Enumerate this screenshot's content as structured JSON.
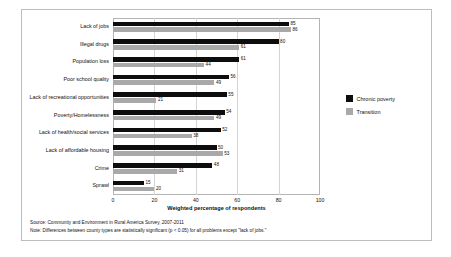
{
  "chart_data": {
    "type": "bar",
    "orientation": "horizontal",
    "title": "",
    "xlabel": "Weighted percentage of respondents",
    "ylabel": "",
    "xlim": [
      0,
      100
    ],
    "xticks": [
      0,
      20,
      40,
      60,
      80,
      100
    ],
    "grid": true,
    "legend_position": "right",
    "categories": [
      "Lack of jobs",
      "Illegal drugs",
      "Population loss",
      "Poor school quality",
      "Lack of recreational opportunities",
      "Poverty/Homelessness",
      "Lack of health/social services",
      "Lack of affordable housing",
      "Crime",
      "Sprawl"
    ],
    "series": [
      {
        "name": "Chronic poverty",
        "color": "#0d0d0d",
        "values": [
          85,
          80,
          61,
          56,
          55,
          54,
          52,
          50,
          48,
          15
        ]
      },
      {
        "name": "Transition",
        "color": "#a9a9a9",
        "values": [
          86,
          61,
          44,
          49,
          21,
          49,
          38,
          53,
          31,
          20
        ]
      }
    ]
  },
  "footnotes": [
    "Source: Community and Environment in Rural America Survey, 2007-2011",
    "Note: Differences between county types are statistically significant (p < 0.05) for all problems except \"lack of jobs.\""
  ]
}
